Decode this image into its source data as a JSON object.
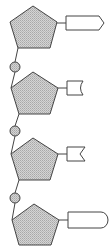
{
  "diagram": {
    "title": "",
    "colors": {
      "sugar_fill": "#c8c8c8",
      "stroke": "#444444",
      "phosphate_fill": "#c8c8c8",
      "base_fill": "#ffffff"
    },
    "nucleotides": [
      {
        "index": 1,
        "sugar": "pentagon",
        "base_shape": "arrow-point",
        "phosphate": false
      },
      {
        "index": 2,
        "sugar": "pentagon",
        "base_shape": "concave-notch",
        "phosphate": true
      },
      {
        "index": 3,
        "sugar": "pentagon",
        "base_shape": "v-notch",
        "phosphate": true
      },
      {
        "index": 4,
        "sugar": "pentagon",
        "base_shape": "rounded-end",
        "phosphate": true
      }
    ]
  }
}
